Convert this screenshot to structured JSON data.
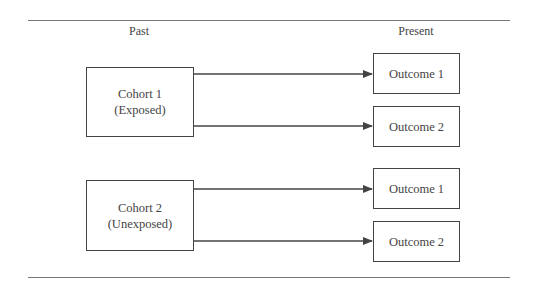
{
  "headers": {
    "past": "Past",
    "present": "Present"
  },
  "cohorts": [
    {
      "name": "Cohort 1",
      "status": "(Exposed)",
      "outcomes": [
        "Outcome 1",
        "Outcome 2"
      ]
    },
    {
      "name": "Cohort 2",
      "status": "(Unexposed)",
      "outcomes": [
        "Outcome 1",
        "Outcome 2"
      ]
    }
  ],
  "colors": {
    "line": "#444444",
    "rule": "#777777"
  }
}
